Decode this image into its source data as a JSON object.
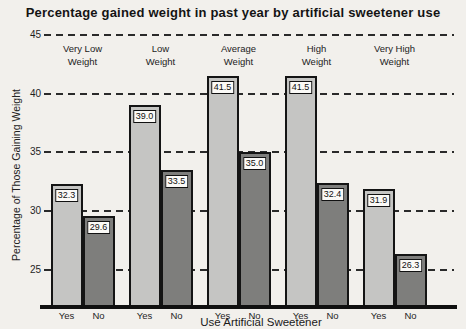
{
  "page": {
    "background": "#f2f0ec",
    "kind": "scanned statistics textbook bar chart"
  },
  "chart_data": {
    "type": "bar",
    "title": "Percentage gained weight in past year by artificial sweetener use",
    "xlabel": "Use Artificial Sweetener",
    "ylabel": "Percentage of Those Gaining Weight",
    "categories": [
      "Very Low Weight",
      "Low Weight",
      "Average Weight",
      "High Weight",
      "Very High Weight"
    ],
    "category_lines": [
      [
        "Very Low",
        "Weight"
      ],
      [
        "Low",
        "Weight"
      ],
      [
        "Average",
        "Weight"
      ],
      [
        "High",
        "Weight"
      ],
      [
        "Very High",
        "Weight"
      ]
    ],
    "series": [
      {
        "name": "Yes",
        "values": [
          32.3,
          39.0,
          41.5,
          41.5,
          31.9
        ],
        "labels": [
          "32.3",
          "39.0",
          "41.5",
          "41.5",
          "31.9"
        ],
        "color": "#c5c5c3"
      },
      {
        "name": "No",
        "values": [
          29.6,
          33.5,
          35.0,
          32.4,
          26.3
        ],
        "labels": [
          "29.6",
          "33.5",
          "35.0",
          "32.4",
          "26.3"
        ],
        "color": "#7e7e7c"
      }
    ],
    "bar_axis_labels": [
      "Yes",
      "No"
    ],
    "yticks": [
      45,
      40,
      35,
      30,
      25
    ],
    "ylim": [
      22,
      45.8
    ],
    "grid": "horizontal dashed lines at each y tick, drawn behind opaque bars",
    "legend_position": "none",
    "colors": {
      "bar_border": "#141414",
      "axis": "#101010",
      "value_box_bg": "#fbfaf7",
      "text": "#1a1a1a"
    }
  }
}
